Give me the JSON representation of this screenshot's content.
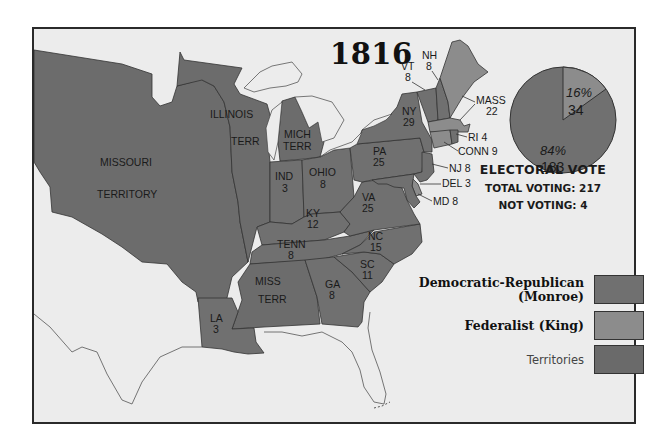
{
  "title": "1816",
  "colors": {
    "background": "#ececec",
    "democratic_republican": "#707070",
    "federalist": "#8c8c8c",
    "territories": "#6a6a6a",
    "water": "#ececec",
    "border": "#2a2a2a"
  },
  "regions": [
    {
      "id": "missouri-territory",
      "label": "MISSOURI",
      "label2": "TERRITORY",
      "party": "territories"
    },
    {
      "id": "illinois-terr",
      "label": "ILLINOIS",
      "label2": "TERR",
      "party": "territories"
    },
    {
      "id": "mich-terr",
      "label": "MICH",
      "label2": "TERR",
      "party": "territories"
    },
    {
      "id": "miss-terr",
      "label": "MISS",
      "label2": "TERR",
      "party": "territories"
    },
    {
      "id": "ind",
      "label": "IND",
      "votes": "3",
      "party": "democratic_republican"
    },
    {
      "id": "ohio",
      "label": "OHIO",
      "votes": "8",
      "party": "democratic_republican"
    },
    {
      "id": "ky",
      "label": "KY",
      "votes": "12",
      "party": "democratic_republican"
    },
    {
      "id": "tenn",
      "label": "TENN",
      "votes": "8",
      "party": "democratic_republican"
    },
    {
      "id": "la",
      "label": "LA",
      "votes": "3",
      "party": "democratic_republican"
    },
    {
      "id": "ga",
      "label": "GA",
      "votes": "8",
      "party": "democratic_republican"
    },
    {
      "id": "sc",
      "label": "SC",
      "votes": "11",
      "party": "democratic_republican"
    },
    {
      "id": "nc",
      "label": "NC",
      "votes": "15",
      "party": "democratic_republican"
    },
    {
      "id": "va",
      "label": "VA",
      "votes": "25",
      "party": "democratic_republican"
    },
    {
      "id": "pa",
      "label": "PA",
      "votes": "25",
      "party": "democratic_republican"
    },
    {
      "id": "ny",
      "label": "NY",
      "votes": "29",
      "party": "democratic_republican"
    },
    {
      "id": "vt",
      "label": "VT",
      "votes": "8",
      "party": "democratic_republican"
    },
    {
      "id": "nh",
      "label": "NH",
      "votes": "8",
      "party": "democratic_republican"
    },
    {
      "id": "mass",
      "label": "MASS",
      "votes": "22",
      "party": "federalist"
    },
    {
      "id": "ri",
      "label": "RI 4",
      "votes": "4",
      "party": "democratic_republican"
    },
    {
      "id": "conn",
      "label": "CONN 9",
      "votes": "9",
      "party": "federalist"
    },
    {
      "id": "nj",
      "label": "NJ 8",
      "votes": "8",
      "party": "democratic_republican"
    },
    {
      "id": "del",
      "label": "DEL 3",
      "votes": "3",
      "party": "federalist"
    },
    {
      "id": "md",
      "label": "MD 8",
      "votes": "8",
      "party": "democratic_republican"
    }
  ],
  "pie": {
    "federalist": {
      "percent": "16%",
      "votes": "34"
    },
    "democratic_republican": {
      "percent": "84%",
      "votes": "183"
    }
  },
  "electoral_vote": {
    "title": "ELECTORAL  VOTE",
    "total_voting": "TOTAL VOTING: 217",
    "not_voting": "NOT VOTING: 4"
  },
  "legend": [
    {
      "label": "Democratic-Republican",
      "sublabel": "(Monroe)",
      "key": "democratic_republican"
    },
    {
      "label": "Federalist (King)",
      "key": "federalist"
    },
    {
      "label": "Territories",
      "key": "territories"
    }
  ]
}
